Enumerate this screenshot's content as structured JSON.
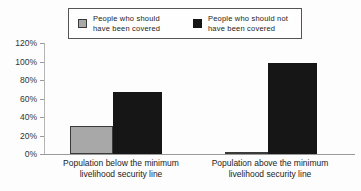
{
  "chart_data": {
    "type": "bar",
    "title": "",
    "categories": [
      "Population below the minimum livelihood security line",
      "Population above the minimum livelihood security line"
    ],
    "series": [
      {
        "name": "People who should have been covered",
        "values": [
          30,
          2
        ],
        "color": "#a8a8a8",
        "border_color": "#3a3a3a"
      },
      {
        "name": "People who should not have been covered",
        "values": [
          67,
          98
        ],
        "color": "#161616",
        "border_color": "#161616"
      }
    ],
    "xlabel": "",
    "ylabel": "",
    "yticks": [
      "0%",
      "20%",
      "40%",
      "60%",
      "80%",
      "100%",
      "120%"
    ],
    "ytick_values": [
      0,
      20,
      40,
      60,
      80,
      100,
      120
    ],
    "ylim": [
      0,
      120
    ],
    "legend_position": "top-center",
    "grid": false,
    "axis_color": "#9a9a9a"
  }
}
